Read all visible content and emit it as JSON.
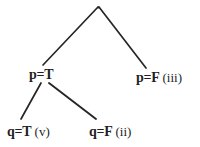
{
  "diagram": {
    "kind": "truth-tree",
    "background_color": "#ffffff",
    "line_color": "#262626",
    "text_color": "#1f1f1f",
    "root": {
      "name": "root-node",
      "label": "",
      "x": 98,
      "y": 7
    },
    "nodes": [
      {
        "name": "node-p-true",
        "assignment": "p=T",
        "tag": "",
        "text": "p=T",
        "x": 42,
        "y": 75
      },
      {
        "name": "node-p-false",
        "assignment": "p=F",
        "tag": "(iii)",
        "text": "p=F (iii)",
        "x": 145,
        "y": 78
      },
      {
        "name": "node-q-true",
        "assignment": "q=T",
        "tag": "(v)",
        "text": "q=T (v)",
        "x": 22,
        "y": 132
      },
      {
        "name": "node-q-false",
        "assignment": "q=F",
        "tag": "(ii)",
        "text": "q=F (ii)",
        "x": 100,
        "y": 132
      }
    ],
    "edges": [
      {
        "name": "edge-root-to-p-true",
        "from": "root-node",
        "to": "node-p-true",
        "x1": 98,
        "y1": 7,
        "x2": 43,
        "y2": 65
      },
      {
        "name": "edge-root-to-p-false",
        "from": "root-node",
        "to": "node-p-false",
        "x1": 99,
        "y1": 7,
        "x2": 146,
        "y2": 68
      },
      {
        "name": "edge-p-true-to-q-true",
        "from": "node-p-true",
        "to": "node-q-true",
        "x1": 41,
        "y1": 83,
        "x2": 21,
        "y2": 119
      },
      {
        "name": "edge-p-true-to-q-false",
        "from": "node-p-true",
        "to": "node-q-false",
        "x1": 49,
        "y1": 83,
        "x2": 96,
        "y2": 119
      }
    ]
  }
}
